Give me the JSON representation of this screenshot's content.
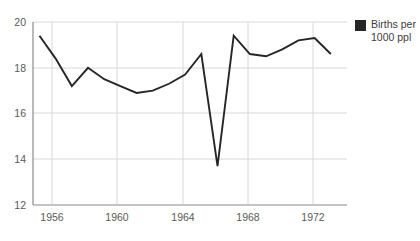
{
  "chart_data": {
    "type": "line",
    "title": "Japanese Birth Rate",
    "xlabel": "",
    "ylabel": "",
    "ylim": [
      12,
      20
    ],
    "xlim": [
      1954.6,
      1974.0
    ],
    "grid": true,
    "legend_position": "right",
    "y_ticks": [
      "20",
      "18",
      "16",
      "14",
      "12"
    ],
    "y_tick_values": [
      20,
      18,
      16,
      14,
      12
    ],
    "x_ticks": [
      "1956",
      "1960",
      "1964",
      "1968",
      "1972"
    ],
    "x_tick_values": [
      1956,
      1960,
      1964,
      1968,
      1972
    ],
    "series": [
      {
        "name": "Births per 1000 ppl",
        "color": "#262626",
        "x": [
          1955,
          1956,
          1957,
          1958,
          1959,
          1960,
          1961,
          1962,
          1963,
          1964,
          1965,
          1966,
          1967,
          1968,
          1969,
          1970,
          1971,
          1972,
          1973
        ],
        "values": [
          19.4,
          18.4,
          17.2,
          18.0,
          17.5,
          17.2,
          16.9,
          17.0,
          17.3,
          17.7,
          18.6,
          13.7,
          19.4,
          18.6,
          18.5,
          18.8,
          19.2,
          19.3,
          18.6
        ]
      }
    ],
    "legend": [
      {
        "label_line1": "Births per",
        "label_line2": "1000 ppl",
        "color": "#262626"
      }
    ]
  }
}
